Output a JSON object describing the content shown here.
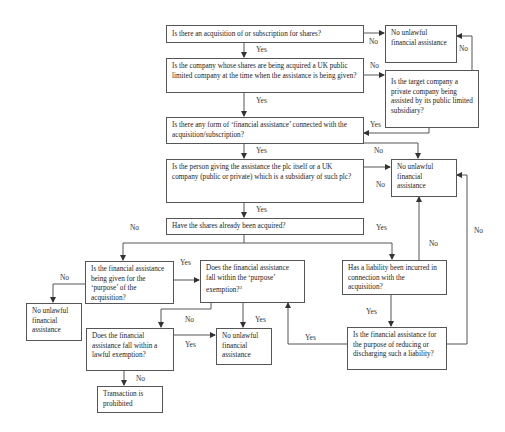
{
  "diagram": {
    "type": "flowchart",
    "nodes": {
      "q_acquisition": "Is there an acquisition of or subscription for shares?",
      "q_uk_plc": "Is the company whose shares are being acquired a UK public limited company at the time when the assistance is being given?",
      "q_private_target": "Is the target company a private company being assisted by its public limited subsidiary?",
      "q_financial_assistance": "Is there any form of ‘financial assistance’ connected with the acquisition/subscription?",
      "q_person_giving": "Is the person giving the assistance the plc itself or a UK company (public or private) which is a subsidiary of such plc?",
      "q_shares_acquired": "Have the shares already been acquired?",
      "q_purpose": "Is the financial assistance being given for the ‘purpose’ of the acquisition?",
      "q_purpose_exemption": "Does the financial assistance fall within the ‘purpose’ exemption?",
      "q_purpose_exemption_footnote": "3",
      "q_liability": "Has a liability been incurred in connection with the acquisition?",
      "q_reducing": "Is the financial assistance for the purpose of reducing or discharging such a liability?",
      "q_lawful_exemption": "Does the financial assistance fall within a lawful exemption?",
      "r_no_unlawful_top": "No unlawful financial assistance",
      "r_no_unlawful_mid": "No unlawful financial assistance",
      "r_no_unlawful_left": "No unlawful financial assistance",
      "r_no_unlawful_bottom": "No unlawful financial assistance",
      "r_prohibited": "Transaction is prohibited"
    },
    "edge_labels": {
      "acq_no": "No",
      "acq_yes": "Yes",
      "private_no": "No",
      "plc_no": "No",
      "plc_yes": "Yes",
      "private_yes": "Yes",
      "fa_no": "No",
      "fa_yes": "Yes",
      "person_no": "No",
      "person_yes": "Yes",
      "shares_no": "No",
      "shares_yes": "Yes",
      "purpose_yes": "Yes",
      "purpose_no": "No",
      "exemption_no": "No",
      "exemption_yes": "Yes",
      "lawful_yes": "Yes",
      "lawful_no": "No",
      "liability_no": "No",
      "liability_yes": "Yes",
      "reducing_yes": "Yes",
      "reducing_no": "No"
    },
    "colors": {
      "line": "#555555",
      "text": "#222222",
      "background": "#ffffff"
    }
  }
}
